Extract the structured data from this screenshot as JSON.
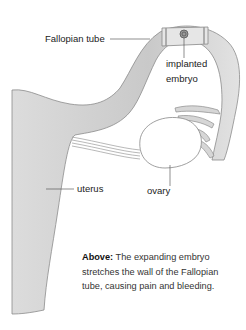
{
  "diagram": {
    "labels": {
      "fallopian_tube": "Fallopian tube",
      "implanted_embryo_line1": "implanted",
      "implanted_embryo_line2": "embryo",
      "uterus": "uterus",
      "ovary": "ovary"
    },
    "caption": {
      "bold": "Above:",
      "text": " The expanding embryo stretches the wall of the Fallopian tube, causing pain and bleeding."
    },
    "colors": {
      "tissue_fill": "#d6d6d6",
      "tissue_stroke": "#8c8c8c",
      "ovary_fill": "#ffffff",
      "leader_line": "#444444"
    }
  }
}
